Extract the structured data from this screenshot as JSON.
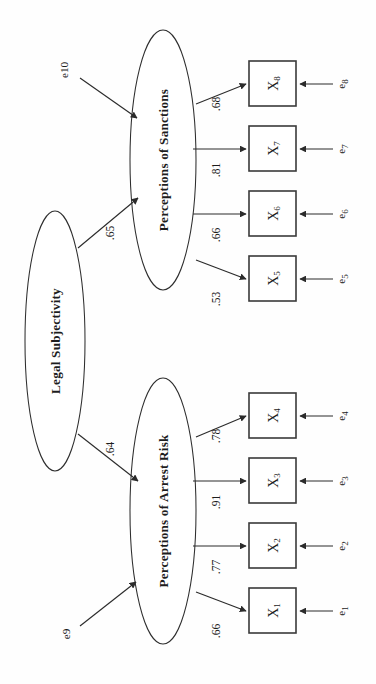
{
  "figure": {
    "type": "path-diagram",
    "orientation": "rotated-90-ccw"
  },
  "latents": [
    {
      "id": "legal-subjectivity",
      "label": "Legal Subjectivity",
      "cx": 55,
      "cy": 341,
      "rx": 30,
      "ry": 130
    },
    {
      "id": "perceptions-of-sanctions",
      "label": "Perceptions of Sanctions",
      "cx": 163,
      "cy": 160,
      "rx": 33,
      "ry": 130
    },
    {
      "id": "perceptions-of-arrest-risk",
      "label": "Perceptions of Arrest Risk",
      "cx": 163,
      "cy": 511,
      "rx": 33,
      "ry": 133
    }
  ],
  "observed": [
    {
      "id": "x8",
      "base": "X",
      "sub": "8",
      "x": 249,
      "y": 61,
      "w": 47,
      "h": 45
    },
    {
      "id": "x7",
      "base": "X",
      "sub": "7",
      "x": 249,
      "y": 126,
      "w": 47,
      "h": 45
    },
    {
      "id": "x6",
      "base": "X",
      "sub": "6",
      "x": 249,
      "y": 191,
      "w": 47,
      "h": 45
    },
    {
      "id": "x5",
      "base": "X",
      "sub": "5",
      "x": 249,
      "y": 256,
      "w": 47,
      "h": 45
    },
    {
      "id": "x4",
      "base": "X",
      "sub": "4",
      "x": 249,
      "y": 393,
      "w": 47,
      "h": 45
    },
    {
      "id": "x3",
      "base": "X",
      "sub": "3",
      "x": 249,
      "y": 458,
      "w": 47,
      "h": 45
    },
    {
      "id": "x2",
      "base": "X",
      "sub": "2",
      "x": 249,
      "y": 523,
      "w": 47,
      "h": 45
    },
    {
      "id": "x1",
      "base": "X",
      "sub": "1",
      "x": 249,
      "y": 588,
      "w": 47,
      "h": 45
    }
  ],
  "errors": [
    {
      "id": "e8",
      "base": "e",
      "sub": "8",
      "label": "e8",
      "lx": 341,
      "ly": 84,
      "line_x1": 333,
      "line_x2": 300,
      "line_y": 84
    },
    {
      "id": "e7",
      "base": "e",
      "sub": "7",
      "label": "e7",
      "lx": 341,
      "ly": 149,
      "line_x1": 333,
      "line_x2": 300,
      "line_y": 149
    },
    {
      "id": "e6",
      "base": "e",
      "sub": "6",
      "label": "e6",
      "lx": 341,
      "ly": 214,
      "line_x1": 333,
      "line_x2": 300,
      "line_y": 214
    },
    {
      "id": "e5",
      "base": "e",
      "sub": "5",
      "label": "e5",
      "lx": 341,
      "ly": 279,
      "line_x1": 333,
      "line_x2": 300,
      "line_y": 279
    },
    {
      "id": "e4",
      "base": "e",
      "sub": "4",
      "label": "e4",
      "lx": 341,
      "ly": 416,
      "line_x1": 333,
      "line_x2": 300,
      "line_y": 416
    },
    {
      "id": "e3",
      "base": "e",
      "sub": "3",
      "label": "e3",
      "lx": 341,
      "ly": 481,
      "line_x1": 333,
      "line_x2": 300,
      "line_y": 481
    },
    {
      "id": "e2",
      "base": "e",
      "sub": "2",
      "label": "e2",
      "lx": 341,
      "ly": 546,
      "line_x1": 333,
      "line_x2": 300,
      "line_y": 546
    },
    {
      "id": "e1",
      "base": "e",
      "sub": "1",
      "label": "e1",
      "lx": 341,
      "ly": 611,
      "line_x1": 333,
      "line_x2": 300,
      "line_y": 611
    }
  ],
  "disturbances": [
    {
      "id": "e10",
      "label": "e10",
      "lx": 64,
      "ly": 70,
      "arrow": {
        "x1": 80,
        "y1": 78,
        "x2": 137,
        "y2": 118
      }
    },
    {
      "id": "e9",
      "label": "e9",
      "lx": 66,
      "ly": 634,
      "arrow": {
        "x1": 80,
        "y1": 626,
        "x2": 136,
        "y2": 582
      }
    }
  ],
  "loadings": [
    {
      "id": "l8",
      "value": ".68",
      "from": "perceptions-of-sanctions",
      "to": "x8",
      "lx": 216,
      "ly": 104,
      "arrow": {
        "x1": 196,
        "y1": 104,
        "x2": 246,
        "y2": 84
      },
      "diagonal": true
    },
    {
      "id": "l7",
      "value": ".81",
      "from": "perceptions-of-sanctions",
      "to": "x7",
      "lx": 216,
      "ly": 170,
      "arrow": {
        "x1": 193,
        "y1": 149,
        "x2": 246,
        "y2": 149
      },
      "diagonal": false
    },
    {
      "id": "l6",
      "value": ".66",
      "from": "perceptions-of-sanctions",
      "to": "x6",
      "lx": 216,
      "ly": 235,
      "arrow": {
        "x1": 193,
        "y1": 214,
        "x2": 246,
        "y2": 214
      },
      "diagonal": false
    },
    {
      "id": "l5",
      "value": ".53",
      "from": "perceptions-of-sanctions",
      "to": "x5",
      "lx": 216,
      "ly": 299,
      "arrow": {
        "x1": 196,
        "y1": 260,
        "x2": 246,
        "y2": 279
      },
      "diagonal": true
    },
    {
      "id": "l4",
      "value": ".78",
      "from": "perceptions-of-arrest-risk",
      "to": "x4",
      "lx": 216,
      "ly": 436,
      "arrow": {
        "x1": 196,
        "y1": 437,
        "x2": 246,
        "y2": 416
      },
      "diagonal": true
    },
    {
      "id": "l3",
      "value": ".91",
      "from": "perceptions-of-arrest-risk",
      "to": "x3",
      "lx": 216,
      "ly": 502,
      "arrow": {
        "x1": 193,
        "y1": 481,
        "x2": 246,
        "y2": 481
      },
      "diagonal": false
    },
    {
      "id": "l2",
      "value": ".77",
      "from": "perceptions-of-arrest-risk",
      "to": "x2",
      "lx": 216,
      "ly": 567,
      "arrow": {
        "x1": 193,
        "y1": 546,
        "x2": 246,
        "y2": 546
      },
      "diagonal": false
    },
    {
      "id": "l1",
      "value": ".66",
      "from": "perceptions-of-arrest-risk",
      "to": "x1",
      "lx": 216,
      "ly": 631,
      "arrow": {
        "x1": 196,
        "y1": 592,
        "x2": 246,
        "y2": 611
      },
      "diagonal": true
    }
  ],
  "structural_paths": [
    {
      "id": "p-sanctions",
      "value": ".65",
      "from": "legal-subjectivity",
      "to": "perceptions-of-sanctions",
      "lx": 110,
      "ly": 233,
      "arrow": {
        "x1": 78,
        "y1": 248,
        "x2": 138,
        "y2": 198
      }
    },
    {
      "id": "p-arrest",
      "value": ".64",
      "from": "legal-subjectivity",
      "to": "perceptions-of-arrest-risk",
      "lx": 110,
      "ly": 449,
      "arrow": {
        "x1": 78,
        "y1": 434,
        "x2": 138,
        "y2": 481
      }
    }
  ],
  "chart_data": {
    "type": "diagram",
    "title": "",
    "model": "Confirmatory factor / structural model",
    "latent_variables": [
      "Legal Subjectivity",
      "Perceptions of Sanctions",
      "Perceptions of Arrest Risk"
    ],
    "indicators": [
      "X1",
      "X2",
      "X3",
      "X4",
      "X5",
      "X6",
      "X7",
      "X8"
    ],
    "error_terms": [
      "e1",
      "e2",
      "e3",
      "e4",
      "e5",
      "e6",
      "e7",
      "e8",
      "e9",
      "e10"
    ],
    "structural_coefficients": [
      {
        "from": "Legal Subjectivity",
        "to": "Perceptions of Sanctions",
        "value": 0.65
      },
      {
        "from": "Legal Subjectivity",
        "to": "Perceptions of Arrest Risk",
        "value": 0.64
      }
    ],
    "factor_loadings": [
      {
        "from": "Perceptions of Sanctions",
        "to": "X8",
        "value": 0.68
      },
      {
        "from": "Perceptions of Sanctions",
        "to": "X7",
        "value": 0.81
      },
      {
        "from": "Perceptions of Sanctions",
        "to": "X6",
        "value": 0.66
      },
      {
        "from": "Perceptions of Sanctions",
        "to": "X5",
        "value": 0.53
      },
      {
        "from": "Perceptions of Arrest Risk",
        "to": "X4",
        "value": 0.78
      },
      {
        "from": "Perceptions of Arrest Risk",
        "to": "X3",
        "value": 0.91
      },
      {
        "from": "Perceptions of Arrest Risk",
        "to": "X2",
        "value": 0.77
      },
      {
        "from": "Perceptions of Arrest Risk",
        "to": "X1",
        "value": 0.66
      }
    ],
    "disturbance_terms": [
      {
        "term": "e10",
        "on": "Perceptions of Sanctions"
      },
      {
        "term": "e9",
        "on": "Perceptions of Arrest Risk"
      }
    ]
  }
}
